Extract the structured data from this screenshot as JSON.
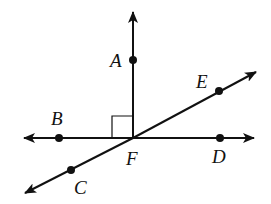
{
  "diagram": {
    "type": "geometry-lines-and-rays",
    "stroke_color": "#111111",
    "background": "#ffffff",
    "center_point": "F",
    "points": [
      {
        "name": "A",
        "label": "A",
        "x": 133,
        "y": 60
      },
      {
        "name": "B",
        "label": "B",
        "x": 59,
        "y": 138
      },
      {
        "name": "C",
        "label": "C",
        "x": 71,
        "y": 170
      },
      {
        "name": "D",
        "label": "D",
        "x": 220,
        "y": 138
      },
      {
        "name": "E",
        "label": "E",
        "x": 219,
        "y": 91
      },
      {
        "name": "F",
        "label": "F",
        "x": 133,
        "y": 138
      }
    ],
    "rays_and_lines": [
      {
        "name": "ray FA",
        "from": "F",
        "through": "A",
        "arrow_end": true
      },
      {
        "name": "line BD",
        "through": [
          "B",
          "F",
          "D"
        ],
        "arrows": "both"
      },
      {
        "name": "line CE",
        "through": [
          "C",
          "F",
          "E"
        ],
        "arrows": "both"
      }
    ],
    "right_angle_marker": {
      "at": "F",
      "between": [
        "A",
        "B"
      ]
    },
    "labels": {
      "A": "A",
      "B": "B",
      "C": "C",
      "D": "D",
      "E": "E",
      "F": "F"
    }
  }
}
